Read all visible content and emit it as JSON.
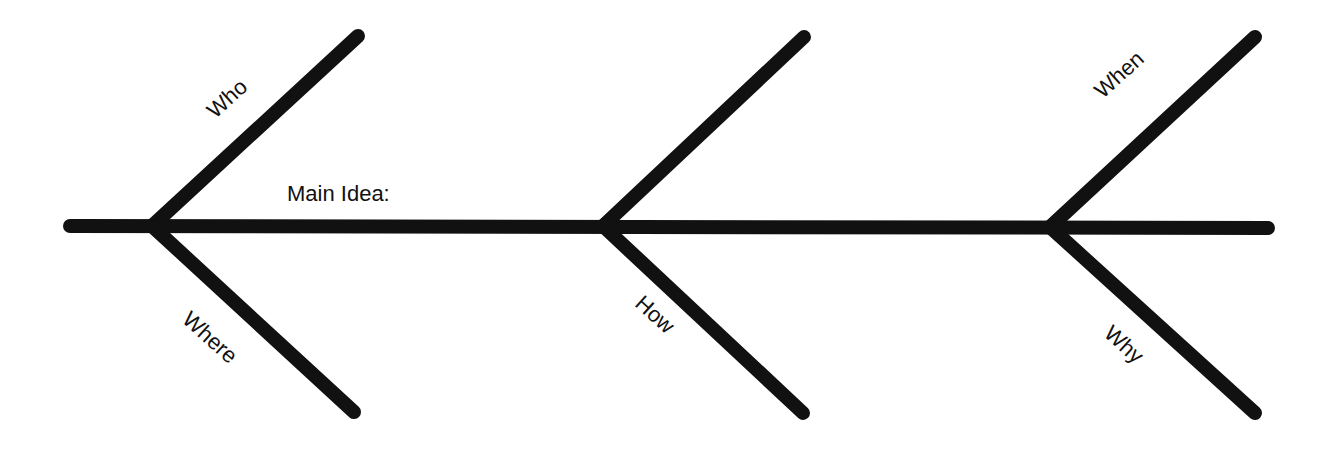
{
  "diagram": {
    "type": "fishbone",
    "main_label": "Main Idea:",
    "branches": [
      {
        "label": "Who",
        "side": "top",
        "joint": "left"
      },
      {
        "label": "Where",
        "side": "bottom",
        "joint": "left"
      },
      {
        "label": "",
        "side": "top",
        "joint": "middle"
      },
      {
        "label": "How",
        "side": "bottom",
        "joint": "middle"
      },
      {
        "label": "When",
        "side": "top",
        "joint": "right"
      },
      {
        "label": "Why",
        "side": "bottom",
        "joint": "right"
      }
    ],
    "line_color": "#111111"
  }
}
